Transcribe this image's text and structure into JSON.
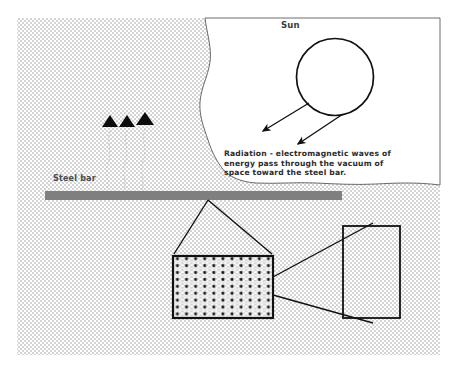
{
  "figure": {
    "title_visible": false,
    "background": "#ffffff",
    "hatch_fill_color": "#d9d9d9",
    "ink_color": "#1a1a1a",
    "steel_bar_color": "#808080",
    "canvas": {
      "width": 450,
      "height": 377
    }
  },
  "labels": {
    "sun": "Sun",
    "steel_bar": "Steel bar",
    "radiation_caption": "Radiation - electromagnetic waves of\nenergy pass through the vacuum of\nspace toward the steel bar."
  },
  "elements": {
    "sun_circle": {
      "cx": 335,
      "cy": 77,
      "r": 38.5
    },
    "radiation_arrows": [
      {
        "x1": 309,
        "y1": 103,
        "x2": 261,
        "y2": 132
      },
      {
        "x1": 343,
        "y1": 114,
        "x2": 296,
        "y2": 145
      }
    ],
    "vacuum_region_note": "irregular white region to the right of wavy boundary",
    "steel_bar": {
      "x": 45,
      "y": 191,
      "width": 297,
      "height": 9
    },
    "emission_markers": {
      "count": 3,
      "description": "three solid black triangles with faint wavy trails",
      "positions": [
        {
          "x": 110,
          "y": 118
        },
        {
          "x": 127,
          "y": 118
        },
        {
          "x": 145,
          "y": 114
        }
      ]
    },
    "magnified_bar_box": {
      "x": 173,
      "y": 256,
      "width": 100,
      "height": 62,
      "dot_columns": 11,
      "dot_rows": 9
    },
    "empty_box": {
      "x": 343,
      "y": 226,
      "width": 57,
      "height": 92
    },
    "callout_lines_to_bar": [
      {
        "x1": 208,
        "y1": 200,
        "x2": 174,
        "y2": 254
      },
      {
        "x1": 208,
        "y1": 200,
        "x2": 272,
        "y2": 254
      }
    ],
    "callout_lines_to_box": [
      {
        "x1": 273,
        "y1": 276,
        "x2": 372,
        "y2": 224
      },
      {
        "x1": 273,
        "y1": 295,
        "x2": 372,
        "y2": 322
      }
    ]
  }
}
